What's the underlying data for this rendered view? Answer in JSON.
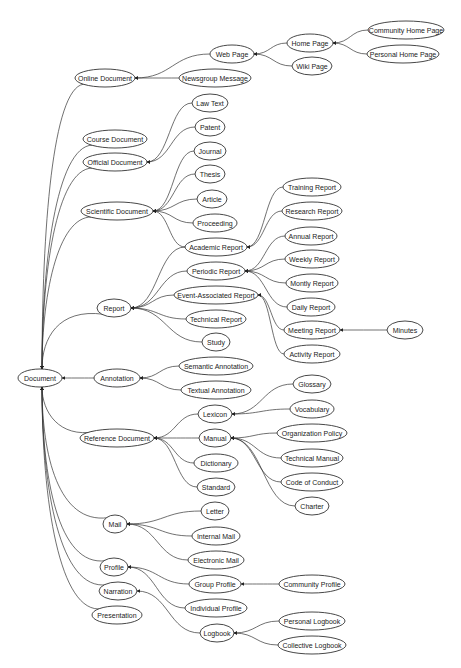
{
  "diagram": {
    "type": "taxonomy-graph",
    "direction": "right-to-left (child → parent)",
    "colors": {
      "background": "#ffffff",
      "stroke": "#333333",
      "text": "#222222"
    },
    "nodes": [
      {
        "id": "document",
        "label": "Document",
        "x": 40,
        "y": 378,
        "rx": 22
      },
      {
        "id": "online_document",
        "label": "Online Document",
        "x": 105,
        "y": 78,
        "rx": 30
      },
      {
        "id": "web_page",
        "label": "Web Page",
        "x": 232,
        "y": 54,
        "rx": 22
      },
      {
        "id": "newsgroup_message",
        "label": "Newsgroup Message",
        "x": 215,
        "y": 78,
        "rx": 36
      },
      {
        "id": "home_page",
        "label": "Home Page",
        "x": 310,
        "y": 43,
        "rx": 23
      },
      {
        "id": "wiki_page",
        "label": "Wiki Page",
        "x": 312,
        "y": 66,
        "rx": 20
      },
      {
        "id": "community_home_page",
        "label": "Community Home Page",
        "x": 406,
        "y": 30,
        "rx": 38
      },
      {
        "id": "personal_home_page",
        "label": "Personal Home Page",
        "x": 403,
        "y": 54,
        "rx": 36
      },
      {
        "id": "course_document",
        "label": "Course Document",
        "x": 115,
        "y": 139,
        "rx": 32
      },
      {
        "id": "official_document",
        "label": "Official Document",
        "x": 115,
        "y": 162,
        "rx": 32
      },
      {
        "id": "law_text",
        "label": "Law Text",
        "x": 210,
        "y": 103,
        "rx": 18
      },
      {
        "id": "patent",
        "label": "Patent",
        "x": 210,
        "y": 127,
        "rx": 15
      },
      {
        "id": "journal",
        "label": "Journal",
        "x": 210,
        "y": 151,
        "rx": 16
      },
      {
        "id": "thesis",
        "label": "Thesis",
        "x": 210,
        "y": 174,
        "rx": 15
      },
      {
        "id": "scientific_document",
        "label": "Scientific Document",
        "x": 117,
        "y": 211,
        "rx": 36
      },
      {
        "id": "article",
        "label": "Article",
        "x": 212,
        "y": 199,
        "rx": 15
      },
      {
        "id": "proceeding",
        "label": "Proceeding",
        "x": 215,
        "y": 223,
        "rx": 22
      },
      {
        "id": "academic_report",
        "label": "Academic Report",
        "x": 216,
        "y": 247,
        "rx": 31
      },
      {
        "id": "training_report",
        "label": "Training Report",
        "x": 312,
        "y": 187,
        "rx": 29
      },
      {
        "id": "research_report",
        "label": "Research Report",
        "x": 312,
        "y": 211,
        "rx": 30
      },
      {
        "id": "report",
        "label": "Report",
        "x": 114,
        "y": 308,
        "rx": 17
      },
      {
        "id": "periodic_report",
        "label": "Periodic Report",
        "x": 216,
        "y": 271,
        "rx": 29
      },
      {
        "id": "annual_report",
        "label": "Annual Report",
        "x": 311,
        "y": 236,
        "rx": 26
      },
      {
        "id": "weekly_report",
        "label": "Weekly Report",
        "x": 312,
        "y": 259,
        "rx": 27
      },
      {
        "id": "monthly_report",
        "label": "Montly Report",
        "x": 312,
        "y": 283,
        "rx": 26
      },
      {
        "id": "event_associated_report",
        "label": "Event-Associated Report",
        "x": 216,
        "y": 295,
        "rx": 42
      },
      {
        "id": "daily_report",
        "label": "Daily Report",
        "x": 311,
        "y": 307,
        "rx": 24
      },
      {
        "id": "meeting_report",
        "label": "Meeting Report",
        "x": 312,
        "y": 330,
        "rx": 28
      },
      {
        "id": "minutes",
        "label": "Minutes",
        "x": 405,
        "y": 330,
        "rx": 18
      },
      {
        "id": "activity_report",
        "label": "Activity Report",
        "x": 312,
        "y": 354,
        "rx": 28
      },
      {
        "id": "technical_report",
        "label": "Technical Report",
        "x": 216,
        "y": 319,
        "rx": 30
      },
      {
        "id": "study",
        "label": "Study",
        "x": 216,
        "y": 342,
        "rx": 14
      },
      {
        "id": "annotation",
        "label": "Annotation",
        "x": 117,
        "y": 378,
        "rx": 23
      },
      {
        "id": "semantic_annotation",
        "label": "Semantic Annotation",
        "x": 216,
        "y": 366,
        "rx": 37
      },
      {
        "id": "textual_annotation",
        "label": "Textual Annotation",
        "x": 216,
        "y": 390,
        "rx": 35
      },
      {
        "id": "lexicon",
        "label": "Lexicon",
        "x": 215,
        "y": 414,
        "rx": 17
      },
      {
        "id": "glossary",
        "label": "Glossary",
        "x": 312,
        "y": 384,
        "rx": 19
      },
      {
        "id": "vocabulary",
        "label": "Vocabulary",
        "x": 312,
        "y": 409,
        "rx": 22
      },
      {
        "id": "reference_document",
        "label": "Reference Document",
        "x": 117,
        "y": 438,
        "rx": 37
      },
      {
        "id": "manual",
        "label": "Manual",
        "x": 215,
        "y": 438,
        "rx": 16
      },
      {
        "id": "organization_policy",
        "label": "Organization Policy",
        "x": 312,
        "y": 433,
        "rx": 35
      },
      {
        "id": "technical_manual",
        "label": "Technical Manual",
        "x": 312,
        "y": 458,
        "rx": 31
      },
      {
        "id": "code_of_conduct",
        "label": "Code of Conduct",
        "x": 312,
        "y": 482,
        "rx": 31
      },
      {
        "id": "charter",
        "label": "Charter",
        "x": 312,
        "y": 506,
        "rx": 17
      },
      {
        "id": "dictionary",
        "label": "Dictionary",
        "x": 216,
        "y": 463,
        "rx": 22
      },
      {
        "id": "standard",
        "label": "Standard",
        "x": 216,
        "y": 487,
        "rx": 19
      },
      {
        "id": "mail",
        "label": "Mail",
        "x": 115,
        "y": 524,
        "rx": 12
      },
      {
        "id": "letter",
        "label": "Letter",
        "x": 215,
        "y": 511,
        "rx": 14
      },
      {
        "id": "internal_mail",
        "label": "Internal Mail",
        "x": 216,
        "y": 536,
        "rx": 24
      },
      {
        "id": "electronic_mail",
        "label": "Electronic Mail",
        "x": 216,
        "y": 560,
        "rx": 28
      },
      {
        "id": "profile",
        "label": "Profile",
        "x": 114,
        "y": 567,
        "rx": 14
      },
      {
        "id": "group_profile",
        "label": "Group Profile",
        "x": 215,
        "y": 584,
        "rx": 26
      },
      {
        "id": "community_profile",
        "label": "Community Profile",
        "x": 312,
        "y": 584,
        "rx": 33
      },
      {
        "id": "individual_profile",
        "label": "Individual Profile",
        "x": 216,
        "y": 608,
        "rx": 31
      },
      {
        "id": "narration",
        "label": "Narration",
        "x": 118,
        "y": 591,
        "rx": 19
      },
      {
        "id": "presentation",
        "label": "Presentation",
        "x": 117,
        "y": 615,
        "rx": 25
      },
      {
        "id": "logbook",
        "label": "Logbook",
        "x": 217,
        "y": 633,
        "rx": 17
      },
      {
        "id": "personal_logbook",
        "label": "Personal Logbook",
        "x": 312,
        "y": 621,
        "rx": 33
      },
      {
        "id": "collective_logbook",
        "label": "Collective Logbook",
        "x": 312,
        "y": 645,
        "rx": 34
      }
    ],
    "edges": [
      {
        "from": "online_document",
        "to": "document"
      },
      {
        "from": "course_document",
        "to": "document"
      },
      {
        "from": "official_document",
        "to": "document"
      },
      {
        "from": "scientific_document",
        "to": "document"
      },
      {
        "from": "report",
        "to": "document"
      },
      {
        "from": "annotation",
        "to": "document"
      },
      {
        "from": "reference_document",
        "to": "document"
      },
      {
        "from": "mail",
        "to": "document"
      },
      {
        "from": "profile",
        "to": "document"
      },
      {
        "from": "narration",
        "to": "document"
      },
      {
        "from": "presentation",
        "to": "document"
      },
      {
        "from": "web_page",
        "to": "online_document"
      },
      {
        "from": "newsgroup_message",
        "to": "online_document"
      },
      {
        "from": "home_page",
        "to": "web_page"
      },
      {
        "from": "wiki_page",
        "to": "web_page"
      },
      {
        "from": "community_home_page",
        "to": "home_page"
      },
      {
        "from": "personal_home_page",
        "to": "home_page"
      },
      {
        "from": "law_text",
        "to": "official_document"
      },
      {
        "from": "patent",
        "to": "official_document"
      },
      {
        "from": "journal",
        "to": "scientific_document"
      },
      {
        "from": "thesis",
        "to": "scientific_document"
      },
      {
        "from": "article",
        "to": "scientific_document"
      },
      {
        "from": "proceeding",
        "to": "scientific_document"
      },
      {
        "from": "academic_report",
        "to": "scientific_document"
      },
      {
        "from": "training_report",
        "to": "academic_report"
      },
      {
        "from": "research_report",
        "to": "academic_report"
      },
      {
        "from": "academic_report",
        "to": "report"
      },
      {
        "from": "periodic_report",
        "to": "report"
      },
      {
        "from": "event_associated_report",
        "to": "report"
      },
      {
        "from": "technical_report",
        "to": "report"
      },
      {
        "from": "study",
        "to": "report"
      },
      {
        "from": "annual_report",
        "to": "periodic_report"
      },
      {
        "from": "weekly_report",
        "to": "periodic_report"
      },
      {
        "from": "monthly_report",
        "to": "periodic_report"
      },
      {
        "from": "daily_report",
        "to": "periodic_report"
      },
      {
        "from": "meeting_report",
        "to": "event_associated_report"
      },
      {
        "from": "activity_report",
        "to": "event_associated_report"
      },
      {
        "from": "minutes",
        "to": "meeting_report"
      },
      {
        "from": "semantic_annotation",
        "to": "annotation"
      },
      {
        "from": "textual_annotation",
        "to": "annotation"
      },
      {
        "from": "lexicon",
        "to": "reference_document"
      },
      {
        "from": "manual",
        "to": "reference_document"
      },
      {
        "from": "dictionary",
        "to": "reference_document"
      },
      {
        "from": "standard",
        "to": "reference_document"
      },
      {
        "from": "glossary",
        "to": "lexicon"
      },
      {
        "from": "vocabulary",
        "to": "lexicon"
      },
      {
        "from": "organization_policy",
        "to": "manual"
      },
      {
        "from": "technical_manual",
        "to": "manual"
      },
      {
        "from": "code_of_conduct",
        "to": "manual"
      },
      {
        "from": "charter",
        "to": "manual"
      },
      {
        "from": "letter",
        "to": "mail"
      },
      {
        "from": "internal_mail",
        "to": "mail"
      },
      {
        "from": "electronic_mail",
        "to": "mail"
      },
      {
        "from": "group_profile",
        "to": "profile"
      },
      {
        "from": "individual_profile",
        "to": "profile"
      },
      {
        "from": "community_profile",
        "to": "group_profile"
      },
      {
        "from": "logbook",
        "to": "narration"
      },
      {
        "from": "personal_logbook",
        "to": "logbook"
      },
      {
        "from": "collective_logbook",
        "to": "logbook"
      }
    ]
  }
}
